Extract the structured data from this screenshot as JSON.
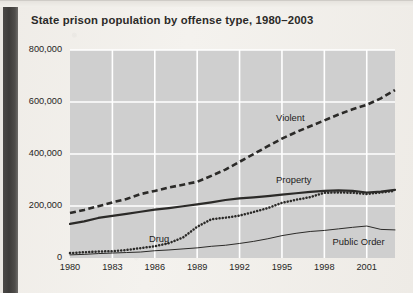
{
  "page": {
    "title": "State prison population by offense type, 1980–2003",
    "gutter_color": "#413f3d",
    "paper_color": "#f1efea",
    "plot_bg_color": "#cfcfcf",
    "gridline_color": "#ffffff",
    "ink_color": "#2b2a28"
  },
  "chart_data": {
    "type": "line",
    "title": "State prison population by offense type, 1980–2003",
    "xlabel": "",
    "ylabel": "",
    "xlim": [
      1980,
      2003
    ],
    "ylim": [
      0,
      800000
    ],
    "grid": true,
    "legend_position": "inline-annotations",
    "ytick_labels": [
      "0",
      "200,000",
      "400,000",
      "600,000",
      "800,000"
    ],
    "ytick_values": [
      0,
      200000,
      400000,
      600000,
      800000
    ],
    "xtick_labels": [
      "1980",
      "1983",
      "1986",
      "1989",
      "1992",
      "1995",
      "1998",
      "2001"
    ],
    "xtick_values": [
      1980,
      1983,
      1986,
      1989,
      1992,
      1995,
      1998,
      2001
    ],
    "x": [
      1980,
      1981,
      1982,
      1983,
      1984,
      1985,
      1986,
      1987,
      1988,
      1989,
      1990,
      1991,
      1992,
      1993,
      1994,
      1995,
      1996,
      1997,
      1998,
      1999,
      2000,
      2001,
      2002,
      2003
    ],
    "series": [
      {
        "name": "Violent",
        "style": "dashed",
        "label": "Violent",
        "values": [
          173000,
          185000,
          199000,
          214000,
          227000,
          246000,
          258000,
          271000,
          282000,
          293000,
          316000,
          340000,
          370000,
          400000,
          430000,
          459000,
          484000,
          507000,
          529000,
          552000,
          572000,
          589000,
          614000,
          646000
        ]
      },
      {
        "name": "Property",
        "style": "solid-thick",
        "label": "Property",
        "values": [
          131000,
          141000,
          154000,
          162000,
          170000,
          178000,
          186000,
          192000,
          199000,
          206000,
          214000,
          223000,
          229000,
          233000,
          238000,
          244000,
          249000,
          254000,
          258000,
          260000,
          258000,
          252000,
          255000,
          262000
        ]
      },
      {
        "name": "Drug",
        "style": "dotted",
        "label": "Drug",
        "values": [
          19000,
          22000,
          25000,
          26000,
          31000,
          38000,
          45000,
          57000,
          79000,
          120000,
          149000,
          155000,
          163000,
          177000,
          192000,
          212000,
          224000,
          234000,
          251000,
          252000,
          251000,
          246000,
          252000,
          258000
        ]
      },
      {
        "name": "Public Order",
        "style": "solid-thin",
        "label": "Public Order",
        "values": [
          12000,
          14000,
          17000,
          19000,
          21000,
          23000,
          28000,
          31000,
          35000,
          39000,
          45000,
          49000,
          56000,
          64000,
          74000,
          86000,
          95000,
          102000,
          106000,
          112000,
          118000,
          123000,
          110000,
          108000
        ]
      }
    ],
    "annotations": [
      {
        "text": "Violent",
        "x": 1996,
        "y": 540000
      },
      {
        "text": "Property",
        "x": 1996,
        "y": 300000
      },
      {
        "text": "Drug",
        "x": 1987,
        "y": 72000
      },
      {
        "text": "Public Order",
        "x": 2000,
        "y": 60000
      }
    ]
  }
}
